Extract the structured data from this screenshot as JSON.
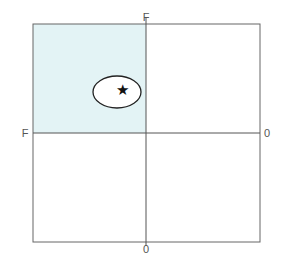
{
  "diagram": {
    "labels": {
      "top": "F",
      "left": "F",
      "right": "0",
      "bottom": "0"
    },
    "shaded_quadrant": "top-left",
    "colors": {
      "shade": "#e3f3f5",
      "line": "#555555",
      "ellipse": "#222222",
      "star": "#111111"
    },
    "marker": {
      "shape": "star",
      "enclosed_by": "ellipse",
      "glyph": "★"
    }
  }
}
